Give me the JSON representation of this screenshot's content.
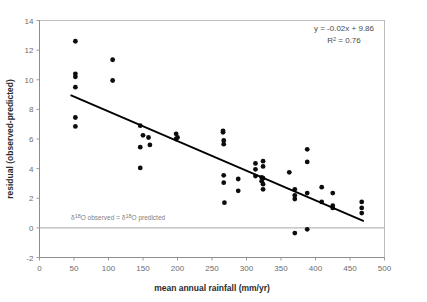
{
  "chart_data": {
    "type": "scatter",
    "title": "",
    "xlabel": "mean annual rainfall (mm/yr)",
    "ylabel": "residual (observed-predicted)",
    "xlim": [
      0,
      500
    ],
    "ylim": [
      -2,
      14
    ],
    "xticks": [
      0,
      50,
      100,
      150,
      200,
      250,
      300,
      350,
      400,
      450,
      500
    ],
    "yticks": [
      -2,
      0,
      2,
      4,
      6,
      8,
      10,
      12,
      14
    ],
    "grid": false,
    "legend": "none",
    "points": [
      [
        52,
        12.6
      ],
      [
        52,
        10.4
      ],
      [
        52,
        10.2
      ],
      [
        52,
        9.5
      ],
      [
        52,
        7.45
      ],
      [
        52,
        6.85
      ],
      [
        106,
        11.35
      ],
      [
        106,
        9.95
      ],
      [
        146,
        6.9
      ],
      [
        146,
        5.45
      ],
      [
        146,
        4.05
      ],
      [
        150,
        6.25
      ],
      [
        158,
        6.1
      ],
      [
        160,
        5.6
      ],
      [
        198,
        6.35
      ],
      [
        198,
        6.0
      ],
      [
        200,
        6.1
      ],
      [
        266,
        6.55
      ],
      [
        266,
        6.45
      ],
      [
        267,
        5.9
      ],
      [
        267,
        5.65
      ],
      [
        267,
        3.55
      ],
      [
        267,
        3.05
      ],
      [
        268,
        1.7
      ],
      [
        288,
        3.3
      ],
      [
        288,
        2.5
      ],
      [
        313,
        4.35
      ],
      [
        313,
        3.95
      ],
      [
        313,
        3.5
      ],
      [
        322,
        3.4
      ],
      [
        322,
        3.15
      ],
      [
        324,
        4.5
      ],
      [
        324,
        4.15
      ],
      [
        324,
        3.35
      ],
      [
        324,
        2.95
      ],
      [
        324,
        2.6
      ],
      [
        362,
        3.75
      ],
      [
        370,
        2.6
      ],
      [
        370,
        2.2
      ],
      [
        370,
        1.95
      ],
      [
        370,
        -0.35
      ],
      [
        388,
        5.3
      ],
      [
        388,
        4.45
      ],
      [
        388,
        2.35
      ],
      [
        388,
        -0.1
      ],
      [
        409,
        2.75
      ],
      [
        409,
        1.75
      ],
      [
        425,
        2.35
      ],
      [
        425,
        1.5
      ],
      [
        425,
        1.35
      ],
      [
        467,
        1.75
      ],
      [
        467,
        1.35
      ],
      [
        467,
        1.0
      ]
    ],
    "trendline": {
      "equation": "y = -0.02x + 9.86",
      "r_squared_label": "R² = 0.76",
      "slope": -0.02,
      "intercept": 9.86,
      "x_start": 45,
      "x_end": 470
    },
    "reference_line": {
      "y": 0,
      "label_prefix": "δ",
      "label_sup": "18",
      "label_mid": "O observed = ",
      "label_sup2": "18",
      "label_end": "O predicted",
      "label_full": "δ18O observed = δ18O predicted"
    },
    "colors": {
      "point": "#0d0d0d",
      "trendline": "#000000",
      "reference_line": "#a6a6a6",
      "axis": "#9a9a9a",
      "tick_text": "#6b6b6b",
      "axis_title": "#2b2b2b",
      "equation_text": "#4a4a4a",
      "annotation_text": "#808080",
      "background": "#ffffff"
    },
    "equation_lines": [
      "y = -0.02x + 9.86",
      "R² = 0.76"
    ]
  }
}
